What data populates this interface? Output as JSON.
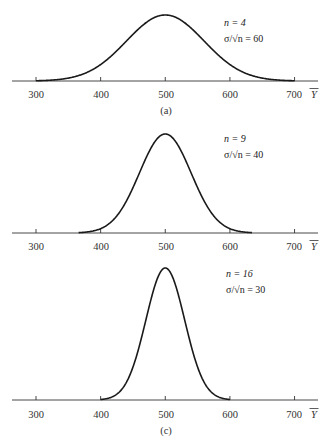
{
  "chart_data": [
    {
      "type": "line",
      "panel_label": "(a)",
      "title": "",
      "xlabel": "Ȳ",
      "ylabel": "",
      "x_ticks": [
        300,
        400,
        500,
        600,
        700
      ],
      "xlim": [
        300,
        700
      ],
      "grid": false,
      "distribution": "normal",
      "mean": 500,
      "sd": 60,
      "annotations": [
        "n = 4",
        "σ/√n = 60"
      ],
      "n": 4,
      "curve_range": [
        300,
        700
      ]
    },
    {
      "type": "line",
      "panel_label": "",
      "title": "",
      "xlabel": "Ȳ",
      "ylabel": "",
      "x_ticks": [
        300,
        400,
        500,
        600,
        700
      ],
      "xlim": [
        300,
        700
      ],
      "grid": false,
      "distribution": "normal",
      "mean": 500,
      "sd": 40,
      "annotations": [
        "n = 9",
        "σ/√n = 40"
      ],
      "n": 9,
      "curve_range": [
        366,
        634
      ]
    },
    {
      "type": "line",
      "panel_label": "(c)",
      "title": "",
      "xlabel": "Ȳ",
      "ylabel": "",
      "x_ticks": [
        300,
        400,
        500,
        600,
        700
      ],
      "xlim": [
        300,
        700
      ],
      "grid": false,
      "distribution": "normal",
      "mean": 500,
      "sd": 30,
      "annotations": [
        "n = 16",
        "σ/√n = 30"
      ],
      "n": 16,
      "curve_range": [
        400,
        600
      ]
    }
  ],
  "panels": [
    {
      "label": "(a)",
      "n_text": "n = 4",
      "se_text": "σ/√n = 60",
      "ticks": [
        "300",
        "400",
        "500",
        "600",
        "700"
      ],
      "axis_symbol": "Y"
    },
    {
      "label": "",
      "n_text": "n = 9",
      "se_text": "σ/√n = 40",
      "ticks": [
        "300",
        "400",
        "500",
        "600",
        "700"
      ],
      "axis_symbol": "Y"
    },
    {
      "label": "(c)",
      "n_text": "n = 16",
      "se_text": "σ/√n = 30",
      "ticks": [
        "300",
        "400",
        "500",
        "600",
        "700"
      ],
      "axis_symbol": "Y"
    }
  ],
  "colors": {
    "curve": "#1a1a1a",
    "axis": "#333333",
    "background": "#ffffff"
  }
}
